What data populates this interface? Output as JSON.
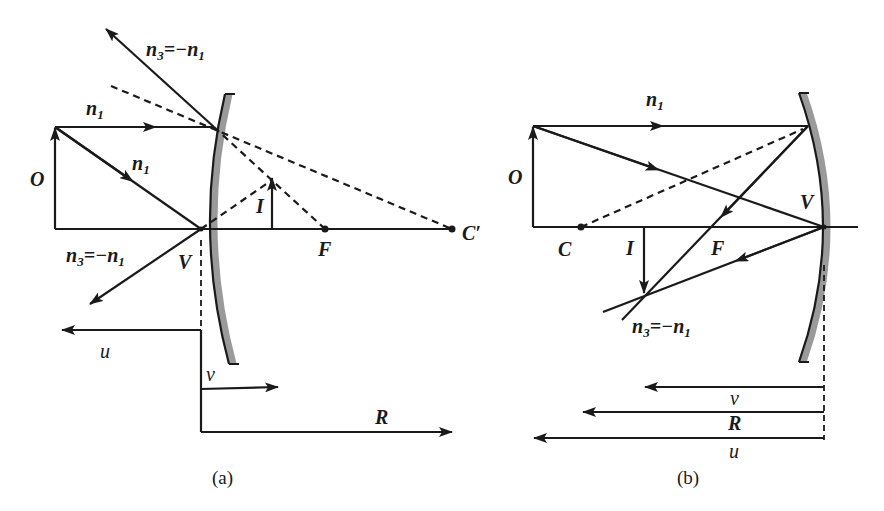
{
  "figure": {
    "panels": [
      {
        "id": "a",
        "caption": "(a)",
        "mirror_type": "convex",
        "labels": {
          "object": "O",
          "image": "I",
          "vertex": "V",
          "focus": "F",
          "center": "C′",
          "incident_top": "n",
          "incident_top_sub": "1",
          "incident_diag": "n",
          "incident_diag_sub": "1",
          "reflected_top": "n",
          "reflected_top_sub": "3",
          "reflected_top_eq": "=−n",
          "reflected_top_eq_sub": "1",
          "reflected_bot": "n",
          "reflected_bot_sub": "3",
          "reflected_bot_eq": "=−n",
          "reflected_bot_eq_sub": "1",
          "dist_u": "u",
          "dist_v": "v",
          "dist_R": "R"
        }
      },
      {
        "id": "b",
        "caption": "(b)",
        "mirror_type": "concave",
        "labels": {
          "object": "O",
          "image": "I",
          "vertex": "V",
          "focus": "F",
          "center": "C",
          "incident_top": "n",
          "incident_top_sub": "1",
          "reflected": "n",
          "reflected_sub": "3",
          "reflected_eq": "=−n",
          "reflected_eq_sub": "1",
          "dist_v": "v",
          "dist_R": "R",
          "dist_u": "u"
        }
      }
    ],
    "colors": {
      "ink": "#1a1a1a",
      "mirror_backing": "#9a9a9a",
      "background": "#ffffff"
    }
  }
}
